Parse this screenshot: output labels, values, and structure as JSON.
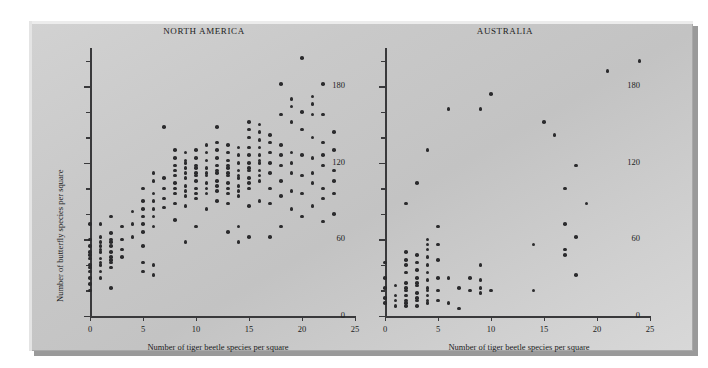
{
  "figure": {
    "background_color": "#ffffff",
    "plate_color": "#cacaca",
    "dot_color": "#2b2b2d",
    "axis_color": "#39393b"
  },
  "chart_data": [
    {
      "type": "scatter",
      "title": "NORTH AMERICA",
      "xlabel": "Number of tiger beetle species per square",
      "ylabel": "Number of butterfly species per square",
      "xlim": [
        0,
        25
      ],
      "ylim": [
        0,
        210
      ],
      "xticks": [
        0,
        5,
        10,
        15,
        20,
        25
      ],
      "xticklabels": [
        "0",
        "5",
        "10",
        "15",
        "20",
        "25"
      ],
      "yticks": [
        0,
        60,
        120,
        180
      ],
      "yticklabels": [
        "0",
        "60",
        "120",
        "180"
      ],
      "y_minor_tick_step": 20,
      "grid": false,
      "legend": null,
      "points": [
        [
          0,
          20
        ],
        [
          0,
          30
        ],
        [
          0,
          35
        ],
        [
          0,
          40
        ],
        [
          0,
          45
        ],
        [
          0,
          50
        ],
        [
          0,
          55
        ],
        [
          0,
          60
        ],
        [
          0,
          72
        ],
        [
          0,
          25
        ],
        [
          0,
          38
        ],
        [
          0,
          48
        ],
        [
          1,
          30
        ],
        [
          1,
          35
        ],
        [
          1,
          40
        ],
        [
          1,
          45
        ],
        [
          1,
          50
        ],
        [
          1,
          55
        ],
        [
          1,
          58
        ],
        [
          1,
          62
        ],
        [
          1,
          72
        ],
        [
          1,
          42
        ],
        [
          1,
          52
        ],
        [
          2,
          22
        ],
        [
          2,
          38
        ],
        [
          2,
          42
        ],
        [
          2,
          46
        ],
        [
          2,
          50
        ],
        [
          2,
          55
        ],
        [
          2,
          60
        ],
        [
          2,
          65
        ],
        [
          2,
          78
        ],
        [
          2,
          44
        ],
        [
          2,
          58
        ],
        [
          3,
          46
        ],
        [
          3,
          52
        ],
        [
          3,
          60
        ],
        [
          3,
          70
        ],
        [
          4,
          62
        ],
        [
          4,
          72
        ],
        [
          4,
          82
        ],
        [
          5,
          35
        ],
        [
          5,
          42
        ],
        [
          5,
          55
        ],
        [
          5,
          66
        ],
        [
          5,
          72
        ],
        [
          5,
          78
        ],
        [
          5,
          84
        ],
        [
          5,
          90
        ],
        [
          5,
          100
        ],
        [
          6,
          32
        ],
        [
          6,
          40
        ],
        [
          6,
          70
        ],
        [
          6,
          78
        ],
        [
          6,
          84
        ],
        [
          6,
          90
        ],
        [
          6,
          96
        ],
        [
          6,
          106
        ],
        [
          6,
          112
        ],
        [
          7,
          148
        ],
        [
          7,
          85
        ],
        [
          7,
          92
        ],
        [
          7,
          100
        ],
        [
          7,
          108
        ],
        [
          8,
          75
        ],
        [
          8,
          88
        ],
        [
          8,
          96
        ],
        [
          8,
          104
        ],
        [
          8,
          110
        ],
        [
          8,
          118
        ],
        [
          8,
          124
        ],
        [
          8,
          130
        ],
        [
          8,
          100
        ],
        [
          8,
          114
        ],
        [
          9,
          58
        ],
        [
          9,
          86
        ],
        [
          9,
          94
        ],
        [
          9,
          102
        ],
        [
          9,
          108
        ],
        [
          9,
          116
        ],
        [
          9,
          122
        ],
        [
          9,
          128
        ],
        [
          9,
          98
        ],
        [
          9,
          112
        ],
        [
          9,
          120
        ],
        [
          10,
          70
        ],
        [
          10,
          92
        ],
        [
          10,
          100
        ],
        [
          10,
          106
        ],
        [
          10,
          112
        ],
        [
          10,
          118
        ],
        [
          10,
          124
        ],
        [
          10,
          130
        ],
        [
          10,
          96
        ],
        [
          10,
          110
        ],
        [
          10,
          116
        ],
        [
          11,
          84
        ],
        [
          11,
          96
        ],
        [
          11,
          104
        ],
        [
          11,
          110
        ],
        [
          11,
          116
        ],
        [
          11,
          122
        ],
        [
          11,
          128
        ],
        [
          11,
          134
        ],
        [
          11,
          100
        ],
        [
          11,
          112
        ],
        [
          12,
          148
        ],
        [
          12,
          90
        ],
        [
          12,
          98
        ],
        [
          12,
          106
        ],
        [
          12,
          112
        ],
        [
          12,
          118
        ],
        [
          12,
          124
        ],
        [
          12,
          130
        ],
        [
          12,
          136
        ],
        [
          12,
          102
        ],
        [
          12,
          114
        ],
        [
          13,
          66
        ],
        [
          13,
          88
        ],
        [
          13,
          96
        ],
        [
          13,
          104
        ],
        [
          13,
          110
        ],
        [
          13,
          116
        ],
        [
          13,
          122
        ],
        [
          13,
          128
        ],
        [
          13,
          134
        ],
        [
          13,
          100
        ],
        [
          13,
          112
        ],
        [
          13,
          118
        ],
        [
          14,
          58
        ],
        [
          14,
          70
        ],
        [
          14,
          94
        ],
        [
          14,
          102
        ],
        [
          14,
          108
        ],
        [
          14,
          114
        ],
        [
          14,
          120
        ],
        [
          14,
          126
        ],
        [
          14,
          132
        ],
        [
          14,
          98
        ],
        [
          14,
          110
        ],
        [
          15,
          62
        ],
        [
          15,
          86
        ],
        [
          15,
          100
        ],
        [
          15,
          108
        ],
        [
          15,
          114
        ],
        [
          15,
          120
        ],
        [
          15,
          126
        ],
        [
          15,
          132
        ],
        [
          15,
          140
        ],
        [
          15,
          104
        ],
        [
          15,
          116
        ],
        [
          15,
          146
        ],
        [
          15,
          152
        ],
        [
          16,
          90
        ],
        [
          16,
          106
        ],
        [
          16,
          114
        ],
        [
          16,
          120
        ],
        [
          16,
          126
        ],
        [
          16,
          132
        ],
        [
          16,
          138
        ],
        [
          16,
          144
        ],
        [
          16,
          150
        ],
        [
          16,
          110
        ],
        [
          16,
          122
        ],
        [
          17,
          100
        ],
        [
          17,
          112
        ],
        [
          17,
          120
        ],
        [
          17,
          128
        ],
        [
          17,
          136
        ],
        [
          17,
          142
        ],
        [
          17,
          62
        ],
        [
          17,
          88
        ],
        [
          18,
          94
        ],
        [
          18,
          118
        ],
        [
          18,
          126
        ],
        [
          18,
          134
        ],
        [
          18,
          158
        ],
        [
          18,
          182
        ],
        [
          18,
          70
        ],
        [
          18,
          106
        ],
        [
          19,
          98
        ],
        [
          19,
          120
        ],
        [
          19,
          128
        ],
        [
          19,
          152
        ],
        [
          19,
          164
        ],
        [
          19,
          170
        ],
        [
          19,
          84
        ],
        [
          19,
          112
        ],
        [
          20,
          110
        ],
        [
          20,
          126
        ],
        [
          20,
          146
        ],
        [
          20,
          160
        ],
        [
          20,
          202
        ],
        [
          20,
          78
        ],
        [
          20,
          96
        ],
        [
          21,
          104
        ],
        [
          21,
          124
        ],
        [
          21,
          140
        ],
        [
          21,
          158
        ],
        [
          21,
          166
        ],
        [
          21,
          172
        ],
        [
          21,
          86
        ],
        [
          21,
          112
        ],
        [
          22,
          100
        ],
        [
          22,
          118
        ],
        [
          22,
          136
        ],
        [
          22,
          158
        ],
        [
          22,
          182
        ],
        [
          22,
          74
        ],
        [
          22,
          92
        ],
        [
          22,
          126
        ],
        [
          23,
          96
        ],
        [
          23,
          114
        ],
        [
          23,
          130
        ],
        [
          23,
          144
        ],
        [
          23,
          80
        ],
        [
          23,
          106
        ]
      ]
    },
    {
      "type": "scatter",
      "title": "AUSTRALIA",
      "xlabel": "Number of tiger beetle species per square",
      "ylabel": "Number of butterfly species per square",
      "xlim": [
        0,
        25
      ],
      "ylim": [
        0,
        210
      ],
      "xticks": [
        0,
        5,
        10,
        15,
        20,
        25
      ],
      "xticklabels": [
        "0",
        "5",
        "10",
        "15",
        "20",
        "25"
      ],
      "yticks": [
        0,
        60,
        120,
        180
      ],
      "yticklabels": [
        "0",
        "60",
        "120",
        "180"
      ],
      "y_minor_tick_step": 20,
      "grid": false,
      "legend": null,
      "points": [
        [
          0,
          10
        ],
        [
          0,
          14
        ],
        [
          0,
          22
        ],
        [
          0,
          30
        ],
        [
          0,
          42
        ],
        [
          1,
          8
        ],
        [
          1,
          12
        ],
        [
          1,
          16
        ],
        [
          1,
          24
        ],
        [
          2,
          8
        ],
        [
          2,
          12
        ],
        [
          2,
          16
        ],
        [
          2,
          20
        ],
        [
          2,
          26
        ],
        [
          2,
          34
        ],
        [
          2,
          40
        ],
        [
          2,
          44
        ],
        [
          2,
          50
        ],
        [
          2,
          10
        ],
        [
          2,
          22
        ],
        [
          2,
          88
        ],
        [
          3,
          8
        ],
        [
          3,
          12
        ],
        [
          3,
          18
        ],
        [
          3,
          24
        ],
        [
          3,
          30
        ],
        [
          3,
          36
        ],
        [
          3,
          42
        ],
        [
          3,
          48
        ],
        [
          3,
          14
        ],
        [
          3,
          26
        ],
        [
          3,
          104
        ],
        [
          4,
          10
        ],
        [
          4,
          16
        ],
        [
          4,
          22
        ],
        [
          4,
          28
        ],
        [
          4,
          34
        ],
        [
          4,
          40
        ],
        [
          4,
          46
        ],
        [
          4,
          52
        ],
        [
          4,
          12
        ],
        [
          4,
          20
        ],
        [
          4,
          56
        ],
        [
          4,
          60
        ],
        [
          4,
          130
        ],
        [
          5,
          12
        ],
        [
          5,
          20
        ],
        [
          5,
          30
        ],
        [
          5,
          44
        ],
        [
          5,
          56
        ],
        [
          5,
          70
        ],
        [
          6,
          10
        ],
        [
          6,
          30
        ],
        [
          6,
          162
        ],
        [
          7,
          6
        ],
        [
          7,
          22
        ],
        [
          8,
          20
        ],
        [
          8,
          30
        ],
        [
          9,
          18
        ],
        [
          9,
          22
        ],
        [
          9,
          28
        ],
        [
          9,
          40
        ],
        [
          9,
          162
        ],
        [
          10,
          20
        ],
        [
          10,
          174
        ],
        [
          14,
          20
        ],
        [
          14,
          56
        ],
        [
          15,
          152
        ],
        [
          16,
          142
        ],
        [
          17,
          48
        ],
        [
          17,
          52
        ],
        [
          17,
          72
        ],
        [
          17,
          100
        ],
        [
          18,
          32
        ],
        [
          18,
          62
        ],
        [
          18,
          118
        ],
        [
          19,
          88
        ],
        [
          21,
          192
        ],
        [
          24,
          200
        ]
      ]
    }
  ]
}
